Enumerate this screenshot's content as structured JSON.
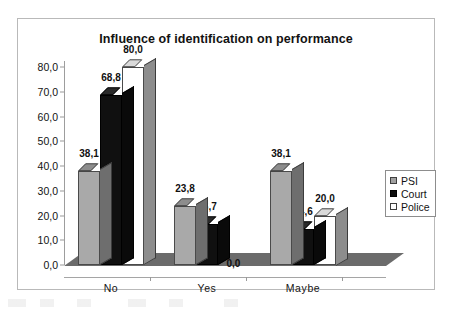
{
  "chart_data": {
    "type": "bar",
    "title": "Influence of identification on performance",
    "xlabel": "",
    "ylabel": "",
    "categories": [
      "No",
      "Yes",
      "Maybe"
    ],
    "series": [
      {
        "name": "PSI",
        "color": "#a9a9a9",
        "values": [
          38.1,
          23.8,
          38.1
        ],
        "labels": [
          "38,1",
          "23,8",
          "38,1"
        ]
      },
      {
        "name": "Court",
        "color": "#101010",
        "values": [
          68.8,
          16.7,
          14.6
        ],
        "labels": [
          "68,8",
          "16,7",
          "14,6"
        ]
      },
      {
        "name": "Police",
        "color": "#ffffff",
        "values": [
          80.0,
          0.0,
          20.0
        ],
        "labels": [
          "80,0",
          "0,0",
          "20,0"
        ]
      }
    ],
    "ylim": [
      0,
      80
    ],
    "ytick_values": [
      0,
      10,
      20,
      30,
      40,
      50,
      60,
      70,
      80
    ],
    "ytick_labels": [
      "0,0",
      "10,0",
      "20,0",
      "30,0",
      "40,0",
      "50,0",
      "60,0",
      "70,0",
      "80,0"
    ],
    "grid": false,
    "legend_position": "right",
    "legend_entries": [
      "PSI",
      "Court",
      "Police"
    ],
    "style": "3d-column",
    "decimal_separator": ","
  },
  "legend": {
    "items": [
      {
        "label": "PSI",
        "swatch": "psi-swatch-icon"
      },
      {
        "label": "Court",
        "swatch": "court-swatch-icon"
      },
      {
        "label": "Police",
        "swatch": "police-swatch-icon"
      }
    ]
  }
}
